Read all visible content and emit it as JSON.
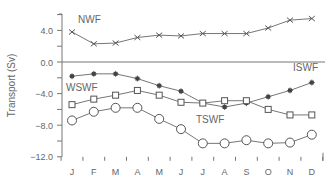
{
  "chart_data": {
    "type": "line",
    "title": "",
    "xlabel": "",
    "ylabel": "Transport (Sv)",
    "categories": [
      "J",
      "F",
      "M",
      "A",
      "M",
      "J",
      "J",
      "A",
      "S",
      "O",
      "N",
      "D"
    ],
    "ylim": [
      -12.0,
      6.0
    ],
    "yticks": [
      4.0,
      0.0,
      -4.0,
      -8.0,
      -12.0
    ],
    "ytick_labels": [
      "4.0",
      "0.0",
      "−4.0",
      "−8.0",
      "−12.0"
    ],
    "zero_line": true,
    "grid": false,
    "legend": "inline labels",
    "series": [
      {
        "name": "NWF",
        "marker": "x",
        "values": [
          3.8,
          2.3,
          2.4,
          3.1,
          3.4,
          3.3,
          3.6,
          3.6,
          3.6,
          4.3,
          5.3,
          5.5
        ]
      },
      {
        "name": "ISWF",
        "marker": "filled-star",
        "values": [
          -1.8,
          -1.5,
          -1.5,
          -2.1,
          -3.0,
          -3.7,
          -5.2,
          -5.7,
          -5.2,
          -4.4,
          -3.6,
          -2.6
        ]
      },
      {
        "name": "WSWF",
        "marker": "open-square",
        "values": [
          -5.4,
          -4.7,
          -4.2,
          -3.6,
          -4.2,
          -5.1,
          -5.2,
          -4.9,
          -4.9,
          -6.0,
          -6.7,
          -6.7
        ]
      },
      {
        "name": "TSWF",
        "marker": "open-circle",
        "values": [
          -7.4,
          -6.3,
          -5.8,
          -5.8,
          -7.2,
          -8.5,
          -10.3,
          -10.3,
          -9.9,
          -10.3,
          -10.2,
          -9.2
        ]
      }
    ],
    "annotations": [
      {
        "text": "NWF",
        "series": "NWF"
      },
      {
        "text": "ISWF",
        "series": "ISWF"
      },
      {
        "text": "WSWF",
        "series": "WSWF"
      },
      {
        "text": "TSWF",
        "series": "TSWF"
      }
    ]
  }
}
